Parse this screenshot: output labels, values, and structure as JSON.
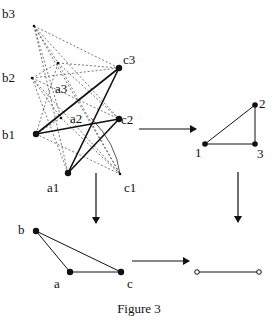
{
  "figure": {
    "caption": "Figure 3",
    "colors": {
      "ink": "#111111",
      "dashed": "#555555",
      "background": "#ffffff"
    }
  },
  "graph_tripartite": {
    "nodes": [
      {
        "id": "b3",
        "label": "b3",
        "x": 34,
        "y": 26,
        "size": "small",
        "lx": 2,
        "ly": 18
      },
      {
        "id": "b2",
        "label": "b2",
        "x": 32,
        "y": 78,
        "size": "small",
        "lx": 2,
        "ly": 82
      },
      {
        "id": "b1",
        "label": "b1",
        "x": 36,
        "y": 134,
        "size": "large",
        "lx": 2,
        "ly": 139
      },
      {
        "id": "a3",
        "label": "a3",
        "x": 58,
        "y": 63,
        "size": "small",
        "lx": 55,
        "ly": 93
      },
      {
        "id": "a2",
        "label": "a2",
        "x": 61,
        "y": 118,
        "size": "small",
        "lx": 70,
        "ly": 123
      },
      {
        "id": "a1",
        "label": "a1",
        "x": 68,
        "y": 173,
        "size": "large",
        "lx": 47,
        "ly": 192
      },
      {
        "id": "c3",
        "label": "c3",
        "x": 119,
        "y": 68,
        "size": "large",
        "lx": 123,
        "ly": 64
      },
      {
        "id": "c2",
        "label": "c2",
        "x": 119,
        "y": 119,
        "size": "large",
        "lx": 121,
        "ly": 124
      },
      {
        "id": "c1",
        "label": "c1",
        "x": 120,
        "y": 174,
        "size": "small",
        "lx": 124,
        "ly": 192
      }
    ],
    "solid_edges": [
      [
        "b1",
        "c3"
      ],
      [
        "b1",
        "c2"
      ],
      [
        "a1",
        "c3"
      ],
      [
        "a1",
        "c2"
      ]
    ],
    "dashed_edges": [
      [
        "b3",
        "a3"
      ],
      [
        "b3",
        "a2"
      ],
      [
        "b3",
        "a1"
      ],
      [
        "b3",
        "c3"
      ],
      [
        "b3",
        "c2"
      ],
      [
        "b3",
        "c1"
      ],
      [
        "b2",
        "a3"
      ],
      [
        "b2",
        "a2"
      ],
      [
        "b2",
        "a1"
      ],
      [
        "b2",
        "c3"
      ],
      [
        "b2",
        "c2"
      ],
      [
        "b2",
        "c1"
      ],
      [
        "b1",
        "a3"
      ],
      [
        "b1",
        "a2"
      ],
      [
        "b1",
        "c1"
      ],
      [
        "a3",
        "c3"
      ],
      [
        "a3",
        "c2"
      ],
      [
        "a3",
        "c1"
      ],
      [
        "a2",
        "c1"
      ]
    ],
    "curve": {
      "from": "a2",
      "to": "c1",
      "note": "thin solid curve"
    }
  },
  "graph_triangle_123": {
    "nodes": [
      {
        "id": "1",
        "label": "1",
        "x": 205,
        "y": 144,
        "lx": 195,
        "ly": 157
      },
      {
        "id": "2",
        "label": "2",
        "x": 255,
        "y": 105,
        "lx": 259,
        "ly": 108
      },
      {
        "id": "3",
        "label": "3",
        "x": 255,
        "y": 144,
        "lx": 257,
        "ly": 158
      }
    ],
    "edges": [
      [
        "1",
        "2"
      ],
      [
        "2",
        "3"
      ],
      [
        "1",
        "3"
      ]
    ]
  },
  "graph_triangle_abc": {
    "nodes": [
      {
        "id": "b",
        "label": "b",
        "x": 36,
        "y": 231,
        "lx": 18,
        "ly": 234
      },
      {
        "id": "a",
        "label": "a",
        "x": 70,
        "y": 272,
        "lx": 54,
        "ly": 288
      },
      {
        "id": "c",
        "label": "c",
        "x": 121,
        "y": 272,
        "lx": 127,
        "ly": 288
      }
    ],
    "edges": [
      [
        "b",
        "a"
      ],
      [
        "b",
        "c"
      ],
      [
        "a",
        "c"
      ]
    ]
  },
  "graph_segment": {
    "nodes": [
      {
        "id": "p",
        "x": 197,
        "y": 272,
        "style": "open"
      },
      {
        "id": "q",
        "x": 259,
        "y": 272,
        "style": "open"
      }
    ],
    "edges": [
      [
        "p",
        "q"
      ]
    ]
  },
  "arrows": [
    {
      "id": "top-right",
      "x1": 139,
      "y1": 129,
      "x2": 196,
      "y2": 129
    },
    {
      "id": "left-down",
      "x1": 96,
      "y1": 173,
      "x2": 96,
      "y2": 223
    },
    {
      "id": "right-down",
      "x1": 238,
      "y1": 172,
      "x2": 238,
      "y2": 222
    },
    {
      "id": "bottom-right",
      "x1": 132,
      "y1": 261,
      "x2": 189,
      "y2": 261
    }
  ]
}
